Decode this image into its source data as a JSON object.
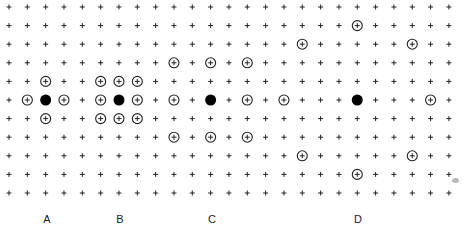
{
  "diagram": {
    "grid": {
      "columns": 25,
      "rows": 11,
      "origin_x": 9,
      "origin_y": 7,
      "spacing_x": 18.33,
      "spacing_y": 18.6,
      "plus_color": "#222222",
      "plus_size": 5
    },
    "marker_style": {
      "circle_radius": 5,
      "circle_stroke": "#222222",
      "filled_radius": 5.5,
      "filled_color": "#000000"
    },
    "groups": [
      {
        "label": "A",
        "label_x": 47,
        "center": {
          "col": 2,
          "row": 5
        },
        "circles": [
          {
            "col": 2,
            "row": 4
          },
          {
            "col": 1,
            "row": 5
          },
          {
            "col": 3,
            "row": 5
          },
          {
            "col": 2,
            "row": 6
          }
        ]
      },
      {
        "label": "B",
        "label_x": 120,
        "center": {
          "col": 6,
          "row": 5
        },
        "circles": [
          {
            "col": 5,
            "row": 4
          },
          {
            "col": 6,
            "row": 4
          },
          {
            "col": 7,
            "row": 4
          },
          {
            "col": 5,
            "row": 5
          },
          {
            "col": 7,
            "row": 5
          },
          {
            "col": 5,
            "row": 6
          },
          {
            "col": 6,
            "row": 6
          },
          {
            "col": 7,
            "row": 6
          }
        ]
      },
      {
        "label": "C",
        "label_x": 212,
        "center": {
          "col": 11,
          "row": 5
        },
        "circles": [
          {
            "col": 9,
            "row": 3
          },
          {
            "col": 11,
            "row": 3
          },
          {
            "col": 13,
            "row": 3
          },
          {
            "col": 9,
            "row": 5
          },
          {
            "col": 13,
            "row": 5
          },
          {
            "col": 9,
            "row": 7
          },
          {
            "col": 11,
            "row": 7
          },
          {
            "col": 13,
            "row": 7
          }
        ]
      },
      {
        "label": "D",
        "label_x": 358,
        "center": {
          "col": 19,
          "row": 5
        },
        "circles": [
          {
            "col": 19,
            "row": 1
          },
          {
            "col": 16,
            "row": 2
          },
          {
            "col": 22,
            "row": 2
          },
          {
            "col": 15,
            "row": 5
          },
          {
            "col": 23,
            "row": 5
          },
          {
            "col": 16,
            "row": 8
          },
          {
            "col": 22,
            "row": 8
          },
          {
            "col": 19,
            "row": 9
          }
        ]
      }
    ],
    "label_y": 219,
    "smudge": {
      "x": 452,
      "y": 178
    }
  }
}
